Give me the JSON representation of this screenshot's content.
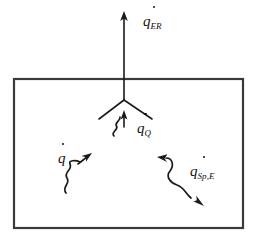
{
  "figure": {
    "background_color": "#ffffff",
    "line_color": "#1a1a1a",
    "enclosure_color": "#3a3a3a",
    "width": 255,
    "height": 239
  },
  "enclosure": {
    "name": "control-volume-box",
    "x": 14,
    "y": 79,
    "width": 229,
    "height": 149
  },
  "labels": {
    "emitted_radiation": {
      "symbol": "q",
      "subscript": "ER",
      "overdot": true,
      "full": "q̇_ER"
    },
    "internal_heat": {
      "symbol": "q",
      "subscript": "Q",
      "overdot": true,
      "full": "q̇_Q"
    },
    "heat_flux": {
      "symbol": "q",
      "subscript": "",
      "overdot": true,
      "full": "q̇"
    },
    "specific_energy": {
      "symbol": "q",
      "subscript": "Sp,E",
      "overdot": true,
      "full": "q̇_Sp,E"
    }
  },
  "arrows": {
    "emitted_radiation_arrow": {
      "kind": "straight",
      "direction": "up",
      "from": [
        124,
        100
      ],
      "to": [
        124,
        14
      ]
    },
    "branch_left": {
      "kind": "straight",
      "from": [
        124,
        100
      ],
      "to": [
        99,
        119
      ]
    },
    "branch_right": {
      "kind": "straight",
      "from": [
        124,
        100
      ],
      "to": [
        152,
        119
      ]
    },
    "internal_heat_arrow": {
      "kind": "wavy",
      "direction": "up",
      "from": [
        114,
        136
      ],
      "to": [
        124,
        112
      ]
    },
    "heat_flux_arrow": {
      "kind": "wavy",
      "direction": "up-right",
      "from": [
        66,
        193
      ],
      "to": [
        89,
        156
      ]
    },
    "specific_energy_arrow": {
      "kind": "wavy",
      "direction": "double-headed",
      "from": [
        159,
        157
      ],
      "to": [
        203,
        205
      ]
    }
  }
}
